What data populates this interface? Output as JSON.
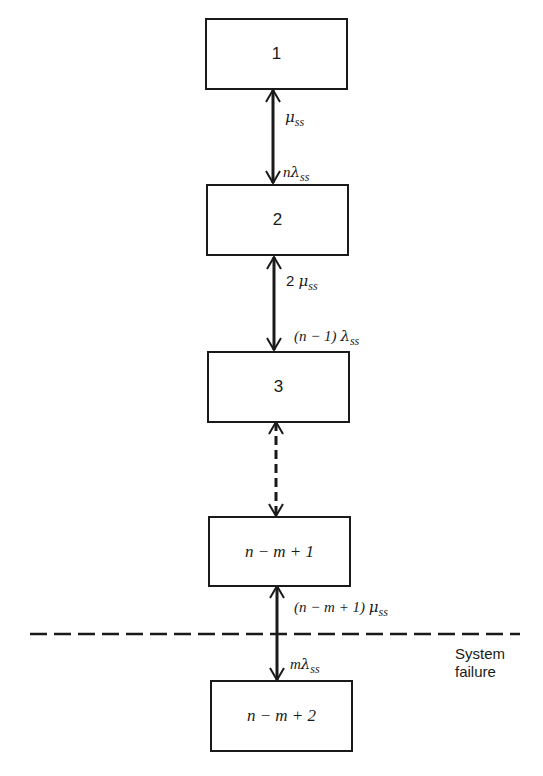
{
  "diagram": {
    "type": "state-transition",
    "states": [
      {
        "id": "1",
        "label": "1"
      },
      {
        "id": "2",
        "label": "2"
      },
      {
        "id": "3",
        "label": "3"
      },
      {
        "id": "n-m+1",
        "label": "n − m + 1"
      },
      {
        "id": "n-m+2",
        "label": "n − m + 2"
      }
    ],
    "transitions": [
      {
        "between": [
          "1",
          "2"
        ],
        "up": "μ_ss",
        "down": "nλ_ss"
      },
      {
        "between": [
          "2",
          "3"
        ],
        "up": "2 μ_ss",
        "down": "(n − 1) λ_ss"
      },
      {
        "between": [
          "3",
          "n-m+1"
        ],
        "style": "dashed"
      },
      {
        "between": [
          "n-m+1",
          "n-m+2"
        ],
        "up": "(n − m + 1) μ_ss",
        "down": "mλ_ss"
      }
    ],
    "labels": {
      "mu": "μ",
      "lambda": "λ",
      "sub": "ss",
      "t1_down_prefix": "n",
      "t2_up_prefix": "2 ",
      "t2_down_prefix": "(n − 1) ",
      "t4_up_prefix": "(n − m + 1) ",
      "t4_down_prefix": "m"
    },
    "boundary": {
      "label_line1": "System",
      "label_line2": "failure",
      "style": "dashed"
    }
  }
}
